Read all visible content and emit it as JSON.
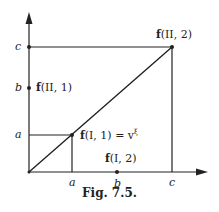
{
  "figure": {
    "caption": "Fig. 7.5.",
    "axis_ticks": {
      "x": [
        "a",
        "b",
        "c"
      ],
      "y": [
        "a",
        "b",
        "c"
      ]
    },
    "points": [
      {
        "name": "f(II,2)",
        "f": "f",
        "args": "(II, 2)"
      },
      {
        "name": "f(II,1)",
        "f": "f",
        "args": "(II, 1)"
      },
      {
        "name": "f(I,1)",
        "f": "f",
        "args": "(I, 1) = v",
        "sup": "ξ"
      },
      {
        "name": "f(I,2)",
        "f": "f",
        "args": "(I, 2)"
      }
    ]
  }
}
